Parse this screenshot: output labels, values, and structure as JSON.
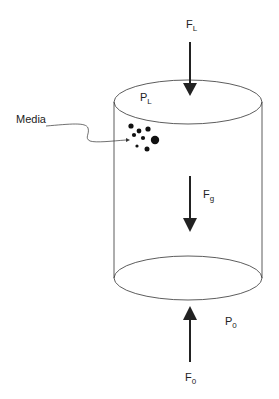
{
  "diagram": {
    "labels": {
      "force_top": "F",
      "force_top_sub": "L",
      "pressure_top": "P",
      "pressure_top_sub": "L",
      "force_gravity": "F",
      "force_gravity_sub": "g",
      "pressure_bottom": "P",
      "pressure_bottom_sub": "0",
      "force_bottom": "F",
      "force_bottom_sub": "0",
      "media": "Media"
    },
    "colors": {
      "stroke": "#222222",
      "background": "#ffffff"
    }
  }
}
